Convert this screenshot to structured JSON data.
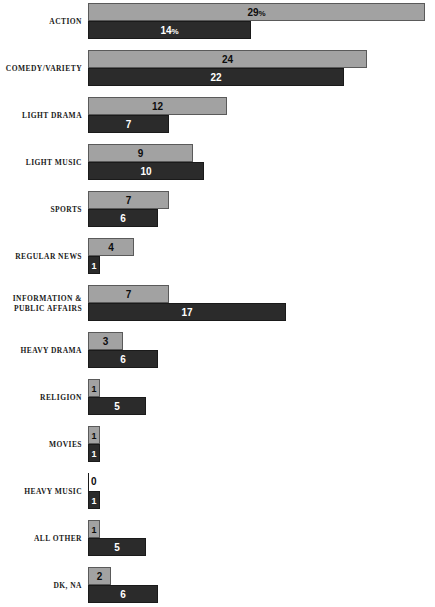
{
  "chart_data": {
    "type": "bar",
    "orientation": "horizontal",
    "title": "",
    "subtitle": "",
    "xlabel": "",
    "ylabel": "",
    "grid": false,
    "legend_position": "none",
    "xlim": [
      0,
      29
    ],
    "value_suffix_first_row_only": "%",
    "categories": [
      "ACTION",
      "COMEDY/VARIETY",
      "LIGHT DRAMA",
      "LIGHT MUSIC",
      "SPORTS",
      "REGULAR NEWS",
      "INFORMATION & PUBLIC AFFAIRS",
      "HEAVY DRAMA",
      "RELIGION",
      "MOVIES",
      "HEAVY MUSIC",
      "ALL OTHER",
      "DK, NA"
    ],
    "series": [
      {
        "name": "light",
        "color": "#a2a2a2",
        "values": [
          29,
          24,
          12,
          9,
          7,
          4,
          7,
          3,
          1,
          1,
          0,
          1,
          2
        ]
      },
      {
        "name": "dark",
        "color": "#2b2b2b",
        "values": [
          14,
          22,
          7,
          10,
          6,
          1,
          17,
          6,
          5,
          1,
          1,
          5,
          6
        ]
      }
    ]
  },
  "rows": [
    {
      "label_lines": [
        "ACTION"
      ],
      "light": {
        "value": 29,
        "display": "29",
        "suffix": "%"
      },
      "dark": {
        "value": 14,
        "display": "14",
        "suffix": "%"
      }
    },
    {
      "label_lines": [
        "COMEDY/VARIETY"
      ],
      "light": {
        "value": 24,
        "display": "24",
        "suffix": ""
      },
      "dark": {
        "value": 22,
        "display": "22",
        "suffix": ""
      }
    },
    {
      "label_lines": [
        "LIGHT DRAMA"
      ],
      "light": {
        "value": 12,
        "display": "12",
        "suffix": ""
      },
      "dark": {
        "value": 7,
        "display": "7",
        "suffix": ""
      }
    },
    {
      "label_lines": [
        "LIGHT MUSIC"
      ],
      "light": {
        "value": 9,
        "display": "9",
        "suffix": ""
      },
      "dark": {
        "value": 10,
        "display": "10",
        "suffix": ""
      }
    },
    {
      "label_lines": [
        "SPORTS"
      ],
      "light": {
        "value": 7,
        "display": "7",
        "suffix": ""
      },
      "dark": {
        "value": 6,
        "display": "6",
        "suffix": ""
      }
    },
    {
      "label_lines": [
        "REGULAR NEWS"
      ],
      "light": {
        "value": 4,
        "display": "4",
        "suffix": ""
      },
      "dark": {
        "value": 1,
        "display": "1",
        "suffix": ""
      }
    },
    {
      "label_lines": [
        "INFORMATION &",
        "PUBLIC AFFAIRS"
      ],
      "light": {
        "value": 7,
        "display": "7",
        "suffix": ""
      },
      "dark": {
        "value": 17,
        "display": "17",
        "suffix": ""
      }
    },
    {
      "label_lines": [
        "HEAVY DRAMA"
      ],
      "light": {
        "value": 3,
        "display": "3",
        "suffix": ""
      },
      "dark": {
        "value": 6,
        "display": "6",
        "suffix": ""
      }
    },
    {
      "label_lines": [
        "RELIGION"
      ],
      "light": {
        "value": 1,
        "display": "1",
        "suffix": ""
      },
      "dark": {
        "value": 5,
        "display": "5",
        "suffix": ""
      }
    },
    {
      "label_lines": [
        "MOVIES"
      ],
      "light": {
        "value": 1,
        "display": "1",
        "suffix": ""
      },
      "dark": {
        "value": 1,
        "display": "1",
        "suffix": ""
      }
    },
    {
      "label_lines": [
        "HEAVY MUSIC"
      ],
      "light": {
        "value": 0,
        "display": "0",
        "suffix": ""
      },
      "dark": {
        "value": 1,
        "display": "1",
        "suffix": ""
      }
    },
    {
      "label_lines": [
        "ALL OTHER"
      ],
      "light": {
        "value": 1,
        "display": "1",
        "suffix": ""
      },
      "dark": {
        "value": 5,
        "display": "5",
        "suffix": ""
      }
    },
    {
      "label_lines": [
        "DK, NA"
      ],
      "light": {
        "value": 2,
        "display": "2",
        "suffix": ""
      },
      "dark": {
        "value": 6,
        "display": "6",
        "suffix": ""
      }
    }
  ],
  "geometry": {
    "bar_origin_x": 88,
    "px_per_unit": 11.62,
    "row_pitch": 47,
    "first_row_top": 2,
    "min_bar_width": 12
  }
}
